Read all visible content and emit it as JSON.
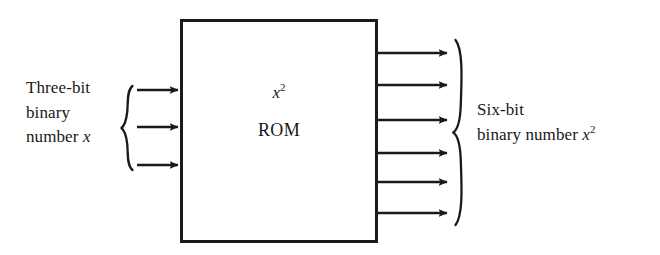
{
  "figure": {
    "name": "rom-squaring-block-diagram",
    "background_color": "#ffffff",
    "stroke_color": "#1a1a1a"
  },
  "block": {
    "label_formula": "x",
    "label_formula_exponent": "2",
    "label_name": "ROM",
    "x": 180,
    "y": 19,
    "width": 198,
    "height": 224,
    "border_color": "#1a1a1a",
    "border_width": 3
  },
  "input": {
    "label_line1": "Three-bit",
    "label_line2": "binary",
    "label_line3_prefix": "number ",
    "label_line3_var": "x",
    "bit_count": 3,
    "arrow_ys": [
      90,
      127,
      165
    ],
    "arrow_x_start": 137,
    "arrow_x_end": 180,
    "brace_x": 124,
    "brace_top": 86,
    "brace_bottom": 170
  },
  "output": {
    "label_line1": "Six-bit",
    "label_line2_prefix": "binary number ",
    "label_line2_var": "x",
    "label_line2_exponent": "2",
    "bit_count": 6,
    "arrow_ys": [
      53,
      85,
      120,
      153,
      182,
      213
    ],
    "arrow_x_start": 378,
    "arrow_x_end": 448,
    "brace_x": 455,
    "brace_top": 40,
    "brace_mid": 132,
    "brace_bottom": 225
  }
}
